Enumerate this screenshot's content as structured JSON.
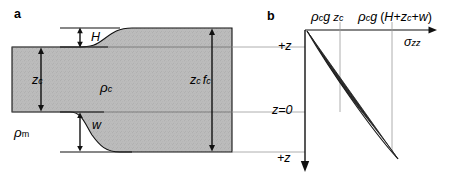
{
  "figure": {
    "background_color": "#ffffff",
    "line_color": "#000000",
    "crust_fill_color": "#b8b8b8",
    "wedge_fill_color": "#2a2a2a",
    "tie_line_color": "#909090"
  },
  "panel_a": {
    "letter": "a",
    "labels": {
      "topography": "H",
      "crust_thickness": "z",
      "crust_thickness_sub": "c",
      "crust_density": "ρ",
      "crust_density_sub": "c",
      "mantle_density": "ρ",
      "mantle_density_sub": "m",
      "root_depth": "w",
      "thick_crust": "z",
      "thick_crust_sub1": "c",
      "thick_crust_f": "f",
      "thick_crust_sub2": "c"
    }
  },
  "panel_b": {
    "letter": "b",
    "axis_label_x": "σ",
    "axis_label_x_sub": "zz",
    "tick_labels": [
      {
        "name": "rho-c-g-zc",
        "rho": "ρ",
        "rho_sub": "c",
        "g": "g",
        "z": "z",
        "z_sub": "c"
      },
      {
        "name": "rho-c-g-H-plus-zc-plus-w",
        "rho": "ρ",
        "rho_sub": "c",
        "g": "g",
        "expr_open": "(",
        "expr_H": "H",
        "expr_plus1": "+",
        "expr_z": "z",
        "expr_z_sub": "c",
        "expr_plus2": "+",
        "expr_w": "w",
        "expr_close": ")"
      }
    ],
    "depth_labels": {
      "top": "+z",
      "zero": "z=0",
      "bottom": "+z"
    }
  }
}
